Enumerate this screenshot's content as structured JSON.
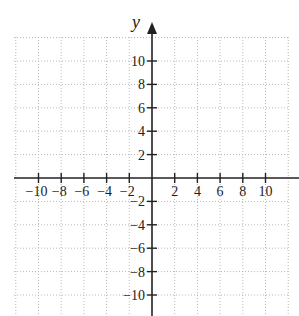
{
  "chart_data": {
    "type": "scatter",
    "title": "",
    "xlabel": "x",
    "ylabel": "y",
    "xlim": [
      -12,
      12
    ],
    "ylim": [
      -12,
      12
    ],
    "grid": true,
    "grid_style": "dotted",
    "grid_step": 1,
    "x_ticks": [
      -10,
      -8,
      -6,
      -4,
      -2,
      2,
      4,
      6,
      8,
      10
    ],
    "y_ticks": [
      10,
      8,
      6,
      4,
      2,
      -2,
      -4,
      -6,
      -8,
      -10
    ],
    "x_tick_labels": [
      "−10",
      "−8",
      "−6",
      "−4",
      "−2",
      "2",
      "4",
      "6",
      "8",
      "10"
    ],
    "y_tick_labels": [
      "10",
      "8",
      "6",
      "4",
      "2",
      "−2",
      "−4",
      "−6",
      "−8",
      "−10"
    ],
    "series": []
  },
  "axes": {
    "y_label": "y",
    "x_label": "x"
  },
  "colors": {
    "axis": "#222222",
    "grid": "#b8b8b8",
    "background": "#ffffff"
  }
}
